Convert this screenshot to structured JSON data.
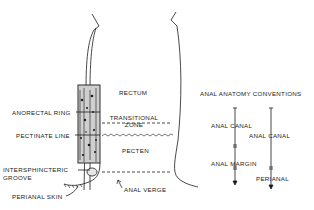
{
  "diagram": {
    "region_labels": {
      "rectum": "RECTUM",
      "transitional_zone_line1": "TRANSITIONAL",
      "transitional_zone_line2": "ZONE",
      "pecten": "PECTEN",
      "anal_verge": "ANAL VERGE"
    },
    "callout_labels": {
      "anorectal_ring": "ANORECTAL RING",
      "pectinate_line": "PECTINATE LINE",
      "intersphincteric_line1": "INTERSPHINCTERIC",
      "intersphincteric_line2": "GROOVE",
      "perianal_skin": "PERIANAL SKIN"
    },
    "conventions": {
      "title": "ANAL ANATOMY CONVENTIONS",
      "left_column": [
        "ANAL CANAL",
        "ANAL MARGIN"
      ],
      "right_column": [
        "ANAL CANAL",
        "PERIANAL"
      ]
    },
    "colors": {
      "ink": "#1a1a1a",
      "background": "#ffffff"
    }
  }
}
